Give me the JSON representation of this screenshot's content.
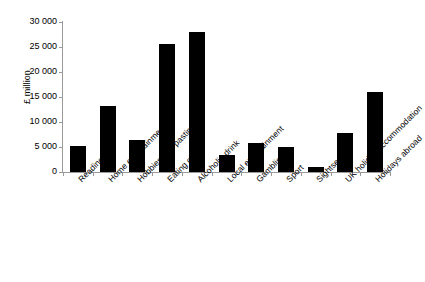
{
  "chart_data": {
    "type": "bar",
    "title": "",
    "subtitle": "",
    "xlabel": "",
    "ylabel": "£ million",
    "ylim": [
      0,
      30000
    ],
    "y_ticks": [
      0,
      5000,
      10000,
      15000,
      20000,
      25000,
      30000
    ],
    "y_tick_labels": [
      "0",
      "5 000",
      "10 000",
      "15 000",
      "20 000",
      "25 000",
      "30 000"
    ],
    "grid": false,
    "legend": null,
    "bar_color": "#000000",
    "categories": [
      "Reading",
      "Home entertainment",
      "Hobbies and pastimes",
      "Eating out",
      "Alcoholic drink",
      "Local entertainment",
      "Gambling",
      "Sport",
      "Sightseeing",
      "UK holiday accommodation",
      "Holidays abroad"
    ],
    "values": [
      5200,
      13200,
      6500,
      25700,
      28000,
      3400,
      5800,
      5000,
      1000,
      7800,
      16000
    ]
  }
}
